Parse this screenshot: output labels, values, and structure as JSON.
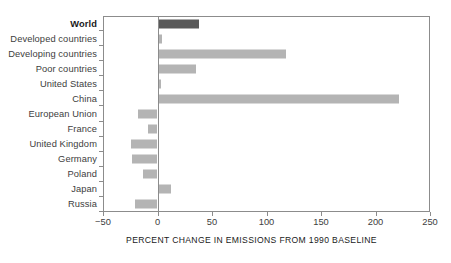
{
  "chart_data": {
    "type": "bar",
    "orientation": "horizontal",
    "title": "",
    "xlabel": "PERCENT CHANGE IN EMISSIONS FROM 1990 BASELINE",
    "ylabel": "",
    "xlim": [
      -50,
      250
    ],
    "xticks": [
      -50,
      0,
      50,
      100,
      150,
      200,
      250
    ],
    "xtick_labels": [
      "−50",
      "0",
      "50",
      "100",
      "150",
      "200",
      "250"
    ],
    "grid": false,
    "legend": false,
    "zero_reference": 0,
    "categories": [
      "World",
      "Developed countries",
      "Developing countries",
      "Poor countries",
      "United States",
      "China",
      "European Union",
      "France",
      "United Kingdom",
      "Germany",
      "Poland",
      "Japan",
      "Russia"
    ],
    "values": [
      38,
      4,
      118,
      35,
      3,
      222,
      -18,
      -9,
      -24,
      -23,
      -13,
      12,
      -21
    ],
    "highlight_index": 0,
    "colors": {
      "bar": "#b4b4b4",
      "bar_highlight": "#595959",
      "axis": "#8c8c8c",
      "text": "#3d3d3d",
      "background": "#ffffff"
    }
  },
  "axis": {
    "x_title": "PERCENT CHANGE IN EMISSIONS FROM 1990 BASELINE"
  }
}
